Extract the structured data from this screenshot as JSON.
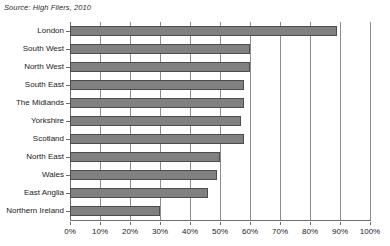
{
  "source_note": "Source: High Fliers, 2010",
  "chart_data": {
    "type": "bar",
    "orientation": "horizontal",
    "title": "",
    "xlabel": "",
    "ylabel": "",
    "xlim": [
      0,
      100
    ],
    "grid": true,
    "legend": false,
    "categories": [
      "London",
      "South West",
      "North West",
      "South East",
      "The Midlands",
      "Yorkshire",
      "Scotland",
      "North East",
      "Wales",
      "East Anglia",
      "Northern Ireland"
    ],
    "values": [
      89,
      60,
      60,
      58,
      58,
      57,
      58,
      50,
      49,
      46,
      30
    ],
    "xticks": [
      0,
      10,
      20,
      30,
      40,
      50,
      60,
      70,
      80,
      90,
      100
    ],
    "xtick_labels": [
      "0%",
      "10%",
      "20%",
      "30%",
      "40%",
      "50%",
      "60%",
      "70%",
      "80%",
      "90%",
      "100%"
    ],
    "bar_color": "#808080",
    "bar_border_color": "#4d4d4d",
    "gridline_color": "#8c8c8c",
    "axis_color": "#6e6e6e"
  }
}
